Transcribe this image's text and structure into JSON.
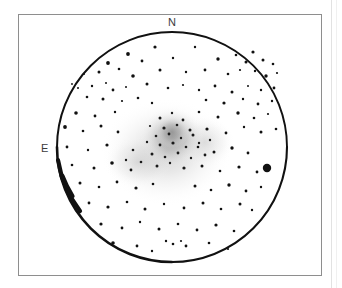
{
  "figure": {
    "type": "astronomical-eyepiece-sketch",
    "background_color": "#ffffff",
    "ink_color": "#111111",
    "frame_color": "#8e8e8e",
    "field_of_view_circle": {
      "center_x": 172,
      "center_y": 147,
      "radius": 115,
      "stroke_color": "#111111",
      "stroke_width_min": 1.4,
      "stroke_width_max": 3.6
    },
    "nebulosity": {
      "label": "unresolved cluster glow",
      "color": "#b9b9b9",
      "core_center_x": 172,
      "core_center_y": 137,
      "core_radius": 30,
      "halo_center_x": 166,
      "halo_center_y": 150,
      "halo_radius": 62
    }
  },
  "labels": {
    "north": "N",
    "east": "E"
  },
  "chart_data": {
    "type": "scatter",
    "title": "",
    "subtitle": "",
    "xlabel": "",
    "ylabel": "",
    "grid": false,
    "legend": null,
    "annotations": [
      {
        "text": "N",
        "x": 172,
        "y": 22,
        "meaning": "north direction marker at top of field"
      },
      {
        "text": "E",
        "x": 44,
        "y": 148,
        "meaning": "east direction marker at left of field"
      }
    ],
    "axis_note": "sky-plane sketch; coordinates are pixel positions inside the field circle",
    "xlim": [
      57,
      287
    ],
    "ylim": [
      32,
      262
    ],
    "series": [
      {
        "name": "field stars",
        "marker": "filled-circle",
        "color": "#111111",
        "points": [
          [
            155,
            47,
            1.6
          ],
          [
            195,
            47,
            1.2
          ],
          [
            128,
            54,
            1.9
          ],
          [
            253,
            52,
            1.6
          ],
          [
            108,
            63,
            1.9
          ],
          [
            142,
            61,
            1.4
          ],
          [
            173,
            58,
            1.2
          ],
          [
            218,
            59,
            1.7
          ],
          [
            236,
            55,
            1.3
          ],
          [
            246,
            62,
            1.5
          ],
          [
            263,
            60,
            1.5
          ],
          [
            273,
            64,
            1.3
          ],
          [
            84,
            74,
            1.0
          ],
          [
            99,
            72,
            1.5
          ],
          [
            119,
            69,
            1.3
          ],
          [
            133,
            76,
            1.8
          ],
          [
            160,
            70,
            1.5
          ],
          [
            186,
            72,
            1.2
          ],
          [
            205,
            70,
            1.4
          ],
          [
            228,
            74,
            1.3
          ],
          [
            240,
            70,
            1.1
          ],
          [
            255,
            71,
            1.2
          ],
          [
            266,
            76,
            1.7
          ],
          [
            277,
            73,
            1.1
          ],
          [
            72,
            84,
            0.9
          ],
          [
            78,
            88,
            1.0
          ],
          [
            92,
            86,
            1.2
          ],
          [
            106,
            83,
            1.0
          ],
          [
            113,
            90,
            1.4
          ],
          [
            126,
            87,
            1.0
          ],
          [
            147,
            84,
            1.5
          ],
          [
            168,
            88,
            1.3
          ],
          [
            183,
            85,
            1.1
          ],
          [
            199,
            90,
            1.2
          ],
          [
            215,
            86,
            1.4
          ],
          [
            232,
            92,
            1.5
          ],
          [
            248,
            86,
            1.0
          ],
          [
            261,
            90,
            1.2
          ],
          [
            274,
            88,
            1.4
          ],
          [
            87,
            97,
            1.3
          ],
          [
            103,
            99,
            1.5
          ],
          [
            122,
            101,
            1.1
          ],
          [
            138,
            98,
            1.3
          ],
          [
            152,
            103,
            1.2
          ],
          [
            206,
            100,
            1.3
          ],
          [
            224,
            103,
            1.6
          ],
          [
            243,
            99,
            1.2
          ],
          [
            258,
            104,
            1.4
          ],
          [
            272,
            101,
            1.2
          ],
          [
            76,
            113,
            1.8
          ],
          [
            95,
            116,
            1.4
          ],
          [
            115,
            112,
            1.2
          ],
          [
            199,
            112,
            1.3
          ],
          [
            218,
            117,
            1.5
          ],
          [
            238,
            113,
            1.7
          ],
          [
            254,
            118,
            1.3
          ],
          [
            268,
            114,
            1.1
          ],
          [
            65,
            127,
            1.9
          ],
          [
            83,
            131,
            1.3
          ],
          [
            101,
            126,
            1.5
          ],
          [
            118,
            132,
            1.4
          ],
          [
            207,
            129,
            1.6
          ],
          [
            226,
            133,
            1.4
          ],
          [
            244,
            127,
            1.2
          ],
          [
            261,
            132,
            1.5
          ],
          [
            276,
            129,
            1.3
          ],
          [
            67,
            147,
            1.4
          ],
          [
            88,
            150,
            1.2
          ],
          [
            107,
            145,
            1.6
          ],
          [
            198,
            147,
            1.3
          ],
          [
            214,
            152,
            1.5
          ],
          [
            232,
            148,
            1.7
          ],
          [
            248,
            153,
            1.4
          ],
          [
            267,
            168,
            4.2
          ],
          [
            72,
            165,
            1.3
          ],
          [
            94,
            168,
            1.5
          ],
          [
            112,
            163,
            1.8
          ],
          [
            131,
            170,
            1.4
          ],
          [
            202,
            166,
            1.5
          ],
          [
            220,
            171,
            1.3
          ],
          [
            239,
            167,
            1.6
          ],
          [
            257,
            172,
            1.4
          ],
          [
            80,
            183,
            1.5
          ],
          [
            99,
            187,
            1.3
          ],
          [
            117,
            182,
            1.4
          ],
          [
            136,
            188,
            1.6
          ],
          [
            153,
            184,
            1.3
          ],
          [
            195,
            186,
            1.5
          ],
          [
            211,
            190,
            1.3
          ],
          [
            229,
            185,
            1.7
          ],
          [
            246,
            191,
            1.4
          ],
          [
            261,
            187,
            1.2
          ],
          [
            89,
            203,
            1.4
          ],
          [
            108,
            207,
            1.6
          ],
          [
            127,
            202,
            1.3
          ],
          [
            145,
            209,
            1.5
          ],
          [
            164,
            204,
            1.2
          ],
          [
            184,
            208,
            1.4
          ],
          [
            203,
            203,
            1.5
          ],
          [
            221,
            209,
            1.3
          ],
          [
            240,
            204,
            1.5
          ],
          [
            252,
            210,
            1.2
          ],
          [
            101,
            224,
            1.6
          ],
          [
            122,
            228,
            1.4
          ],
          [
            140,
            222,
            1.2
          ],
          [
            159,
            229,
            1.5
          ],
          [
            178,
            224,
            1.3
          ],
          [
            197,
            230,
            1.4
          ],
          [
            216,
            225,
            1.6
          ],
          [
            234,
            231,
            1.3
          ],
          [
            113,
            243,
            1.8
          ],
          [
            137,
            246,
            1.4
          ],
          [
            166,
            241,
            1.2
          ],
          [
            173,
            244,
            1.3
          ],
          [
            181,
            241,
            1.1
          ],
          [
            186,
            246,
            1.4
          ],
          [
            209,
            243,
            1.3
          ],
          [
            152,
            251,
            1.2
          ],
          [
            228,
            249,
            1.1
          ]
        ]
      },
      {
        "name": "resolved cluster members",
        "marker": "filled-circle",
        "color": "#1a1a1a",
        "points": [
          [
            160,
            118,
            1.5
          ],
          [
            172,
            113,
            1.2
          ],
          [
            183,
            120,
            1.4
          ],
          [
            150,
            126,
            1.1
          ],
          [
            164,
            128,
            1.6
          ],
          [
            177,
            125,
            1.3
          ],
          [
            190,
            130,
            1.5
          ],
          [
            156,
            136,
            1.3
          ],
          [
            169,
            134,
            1.4
          ],
          [
            181,
            138,
            1.2
          ],
          [
            193,
            135,
            1.5
          ],
          [
            147,
            142,
            1.2
          ],
          [
            160,
            145,
            1.4
          ],
          [
            173,
            143,
            1.6
          ],
          [
            186,
            147,
            1.3
          ],
          [
            199,
            143,
            1.2
          ],
          [
            152,
            154,
            1.5
          ],
          [
            165,
            157,
            1.3
          ],
          [
            178,
            153,
            1.4
          ],
          [
            191,
            158,
            1.2
          ],
          [
            141,
            162,
            1.3
          ],
          [
            157,
            166,
            1.5
          ],
          [
            170,
            163,
            1.2
          ],
          [
            184,
            168,
            1.6
          ],
          [
            133,
            150,
            1.3
          ],
          [
            126,
            160,
            1.2
          ],
          [
            205,
            155,
            1.4
          ],
          [
            210,
            140,
            1.2
          ]
        ]
      }
    ]
  }
}
